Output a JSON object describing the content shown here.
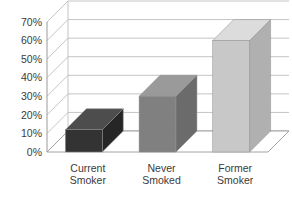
{
  "chart_data": {
    "type": "bar",
    "title": "",
    "subtitle": "",
    "xlabel": "",
    "ylabel": "",
    "categories": [
      "Current Smoker",
      "Never Smoked",
      "Former Smoker"
    ],
    "category_lines": [
      [
        "Current",
        "Smoker"
      ],
      [
        "Never",
        "Smoked"
      ],
      [
        "Former",
        "Smoker"
      ]
    ],
    "values": [
      12,
      30,
      60
    ],
    "ylim": [
      0,
      70
    ],
    "ytick_values": [
      0,
      10,
      20,
      30,
      40,
      50,
      60,
      70
    ],
    "ytick_labels": [
      "0%",
      "10%",
      "20%",
      "30%",
      "40%",
      "50%",
      "60%",
      "70%"
    ],
    "grid": true,
    "legend": "none",
    "three_d": true,
    "bar_colors": [
      "#333333",
      "#808080",
      "#c8c8c8"
    ],
    "bar_top_colors": [
      "#4d4d4d",
      "#9a9a9a",
      "#dcdcdc"
    ],
    "bar_side_colors": [
      "#262626",
      "#6b6b6b",
      "#b0b0b0"
    ],
    "axis_color": "#9a9a9a",
    "grid_color": "#b5b5b5",
    "background": "#ffffff"
  },
  "axis": {
    "ticks": [
      {
        "label": "70%",
        "value": 70
      },
      {
        "label": "60%",
        "value": 60
      },
      {
        "label": "50%",
        "value": 50
      },
      {
        "label": "40%",
        "value": 40
      },
      {
        "label": "30%",
        "value": 30
      },
      {
        "label": "20%",
        "value": 20
      },
      {
        "label": "10%",
        "value": 10
      },
      {
        "label": "0%",
        "value": 0
      }
    ]
  }
}
